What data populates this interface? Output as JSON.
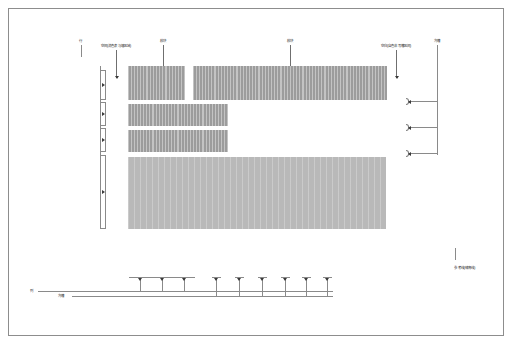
{
  "sheet": {
    "background": "#ffffff",
    "frame_color": "#8d8d8d"
  },
  "colors": {
    "block_fill": "#9c9c9c",
    "slab_fill": "#b9b9b9",
    "line": "#8a8a8a",
    "arrow": "#3a3a3a",
    "text": "#2b2b2b"
  },
  "labels": {
    "row_axis": "行",
    "column_axis": "列",
    "gap_label_left": "空间(消色表与墙区域)",
    "gap_label_right": "空白(自色非写槽区间)",
    "module_left": "模块",
    "module_right": "模块",
    "groove_top_right": "沟槽",
    "groove_bottom": "沟槽",
    "reference_note": "参考线(辅育线)"
  },
  "top_leaders": [
    {
      "name": "gap-left-leader",
      "label": "空间(消色表与墙区域)"
    },
    {
      "name": "module-left-leader",
      "label": "模块"
    },
    {
      "name": "module-right-leader",
      "label": "模块"
    },
    {
      "name": "gap-right-leader",
      "label": "空白(自色非写槽区间)"
    }
  ],
  "rows": [
    {
      "id": "row-1",
      "left": 128,
      "top": 66,
      "height": 34,
      "segments": [
        {
          "type": "cell",
          "width": 19
        },
        {
          "type": "cell",
          "width": 19
        },
        {
          "type": "cell",
          "width": 19
        },
        {
          "type": "gap",
          "width": 8
        },
        {
          "type": "cell",
          "width": 22
        },
        {
          "type": "cell",
          "width": 22
        },
        {
          "type": "cell",
          "width": 22
        },
        {
          "type": "cell",
          "width": 22
        },
        {
          "type": "cell",
          "width": 22
        },
        {
          "type": "cell",
          "width": 22
        },
        {
          "type": "cell",
          "width": 22
        },
        {
          "type": "cell",
          "width": 22
        },
        {
          "type": "cell",
          "width": 18
        }
      ]
    },
    {
      "id": "row-2",
      "left": 128,
      "top": 104,
      "height": 22,
      "segments": [
        {
          "type": "cell",
          "width": 25
        },
        {
          "type": "cell",
          "width": 25
        },
        {
          "type": "cell",
          "width": 25
        },
        {
          "type": "cell",
          "width": 25
        }
      ]
    },
    {
      "id": "row-3",
      "left": 128,
      "top": 130,
      "height": 22,
      "segments": [
        {
          "type": "cell",
          "width": 25
        },
        {
          "type": "cell",
          "width": 25
        },
        {
          "type": "cell",
          "width": 25
        },
        {
          "type": "cell",
          "width": 25
        }
      ]
    }
  ],
  "slab": {
    "id": "slab-main",
    "left": 128,
    "top": 157,
    "width": 258,
    "height": 72
  },
  "left_dimensions": [
    {
      "name": "left-dim-1",
      "top": 70,
      "height": 30
    },
    {
      "name": "left-dim-2",
      "top": 102,
      "height": 24
    },
    {
      "name": "left-dim-3",
      "top": 128,
      "height": 24
    },
    {
      "name": "left-dim-4",
      "top": 155,
      "height": 74
    }
  ],
  "right_brackets": [
    {
      "name": "right-bracket-1",
      "top": 98,
      "stem": 28
    },
    {
      "name": "right-bracket-2",
      "top": 124,
      "stem": 28
    },
    {
      "name": "right-bracket-3",
      "top": 150,
      "stem": 28
    }
  ],
  "bottom_markers": {
    "wide": [
      {
        "name": "bottom-span-1",
        "center": 140,
        "cap": 22
      },
      {
        "name": "bottom-span-2",
        "center": 162,
        "cap": 22
      },
      {
        "name": "bottom-span-3",
        "center": 184,
        "cap": 22
      }
    ],
    "narrow": [
      {
        "name": "bottom-tick-1",
        "center": 216,
        "cap": 9
      },
      {
        "name": "bottom-tick-2",
        "center": 239,
        "cap": 9
      },
      {
        "name": "bottom-tick-3",
        "center": 262,
        "cap": 9
      },
      {
        "name": "bottom-tick-4",
        "center": 285,
        "cap": 9
      },
      {
        "name": "bottom-tick-5",
        "center": 306,
        "cap": 9
      },
      {
        "name": "bottom-tick-6",
        "center": 327,
        "cap": 9
      }
    ]
  }
}
